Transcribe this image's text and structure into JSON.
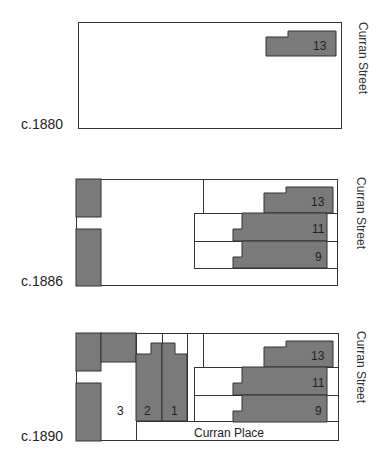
{
  "colors": {
    "fill": "#7a7a7a",
    "stroke": "#333333",
    "text": "#222222"
  },
  "panels": [
    {
      "year": "c.1880",
      "street": "Curran Street"
    },
    {
      "year": "c.1886",
      "street": "Curran Street"
    },
    {
      "year": "c.1890",
      "street": "Curran Street",
      "lane": "Curran Place"
    }
  ],
  "lots": {
    "p1": [
      "13"
    ],
    "p2": [
      "13",
      "11",
      "9"
    ],
    "p3": [
      "13",
      "11",
      "9",
      "3",
      "2",
      "1"
    ]
  }
}
